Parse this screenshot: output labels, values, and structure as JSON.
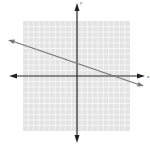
{
  "chart_data": {
    "type": "line",
    "title": "",
    "xlabel": "x",
    "ylabel": "y",
    "xlim": [
      -10,
      10
    ],
    "ylim": [
      -10,
      10
    ],
    "grid": true,
    "series": [
      {
        "name": "line",
        "x": [
          -13,
          12
        ],
        "y": [
          6.8,
          -1.8
        ]
      }
    ],
    "slope": -0.33,
    "y_intercept": 2.6
  },
  "labels": {
    "x_axis": "x",
    "y_axis": "y"
  },
  "colors": {
    "grid_bg": "#e6e6e6",
    "grid_line": "#ffffff",
    "axis": "#222222",
    "line": "#777777"
  }
}
